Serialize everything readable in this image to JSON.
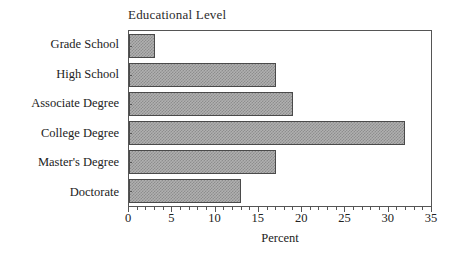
{
  "chart_data": {
    "type": "bar",
    "orientation": "horizontal",
    "title": "Educational Level",
    "xlabel": "Percent",
    "ylabel": "",
    "categories": [
      "Grade School",
      "High School",
      "Associate Degree",
      "College Degree",
      "Master's Degree",
      "Doctorate"
    ],
    "values": [
      3,
      17,
      19,
      32,
      17,
      13
    ],
    "xlim": [
      0,
      35
    ],
    "xticks": [
      0,
      5,
      10,
      15,
      20,
      25,
      30,
      35
    ],
    "xtick_labels": [
      "0",
      "5",
      "10",
      "15",
      "20",
      "25",
      "30",
      "35"
    ],
    "minor_tick_step": 1,
    "grid": false,
    "legend": null,
    "bar_fill": "#b0b0b0",
    "bar_pattern": "checkered-gray-halftone",
    "bar_edge_color": "#4a4a4a",
    "background": "#ffffff",
    "axis_color": "#555555",
    "series": [
      {
        "name": "Percent",
        "values": [
          3,
          17,
          19,
          32,
          17,
          13
        ]
      }
    ],
    "points": [
      {
        "category": "Grade School",
        "value": 3
      },
      {
        "category": "High School",
        "value": 17
      },
      {
        "category": "Associate Degree",
        "value": 19
      },
      {
        "category": "College Degree",
        "value": 32
      },
      {
        "category": "Master's Degree",
        "value": 17
      },
      {
        "category": "Doctorate",
        "value": 13
      }
    ]
  }
}
